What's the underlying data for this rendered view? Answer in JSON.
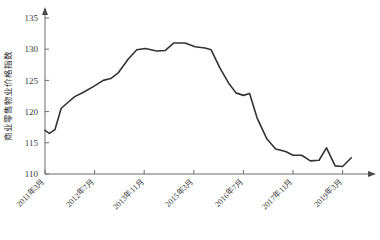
{
  "chart_data": {
    "type": "line",
    "title": "",
    "xlabel": "",
    "ylabel": "商业零售物业价格指数",
    "ylim": [
      110,
      135
    ],
    "yticks": [
      110,
      115,
      120,
      125,
      130,
      135
    ],
    "grid": false,
    "legend": null,
    "axis_arrows": true,
    "line_color": "#333333",
    "xtick_labels": [
      "2011年3月",
      "2012年7月",
      "2013年11月",
      "2015年3月",
      "2016年7月",
      "2017年11月",
      "2019年3月"
    ],
    "xtick_indices": [
      0,
      4,
      8,
      12,
      16,
      20,
      24
    ],
    "x": [
      "2011年3月",
      "2011年7月",
      "2011年11月",
      "2012年3月",
      "2012年7月",
      "2012年11月",
      "2013年3月",
      "2013年7月",
      "2013年11月",
      "2014年3月",
      "2014年7月",
      "2014年11月",
      "2015年3月",
      "2015年7月",
      "2015年11月",
      "2016年3月",
      "2016年7月",
      "2016年11月",
      "2017年3月",
      "2017年7月",
      "2017年11月",
      "2018年3月",
      "2018年7月",
      "2018年11月",
      "2019年3月",
      "2019年7月"
    ],
    "values": [
      117.0,
      116.6,
      117.2,
      120.8,
      122.3,
      123.5,
      124.1,
      125.4,
      126.2,
      126.4,
      128.3,
      130.0,
      130.2,
      129.8,
      131.0,
      130.9,
      130.4,
      130.2,
      127.0,
      125.3,
      125.4,
      122.6,
      122.4,
      116.0,
      114.2,
      114.0
    ],
    "tail_detail": {
      "note": "final segment dips then recovers",
      "points": [
        113.9,
        113.0,
        114.4,
        111.2,
        112.6
      ]
    },
    "series_path": [
      {
        "xi": 0.0,
        "v": 117.0
      },
      {
        "xi": 0.35,
        "v": 116.5
      },
      {
        "xi": 0.8,
        "v": 117.1
      },
      {
        "xi": 1.3,
        "v": 120.5
      },
      {
        "xi": 1.75,
        "v": 121.3
      },
      {
        "xi": 2.4,
        "v": 122.4
      },
      {
        "xi": 3.1,
        "v": 123.1
      },
      {
        "xi": 3.9,
        "v": 124.0
      },
      {
        "xi": 4.7,
        "v": 125.0
      },
      {
        "xi": 5.3,
        "v": 125.3
      },
      {
        "xi": 5.9,
        "v": 126.2
      },
      {
        "xi": 6.7,
        "v": 128.4
      },
      {
        "xi": 7.4,
        "v": 129.9
      },
      {
        "xi": 8.1,
        "v": 130.1
      },
      {
        "xi": 9.0,
        "v": 129.7
      },
      {
        "xi": 9.7,
        "v": 129.8
      },
      {
        "xi": 10.4,
        "v": 131.0
      },
      {
        "xi": 11.3,
        "v": 131.0
      },
      {
        "xi": 12.1,
        "v": 130.4
      },
      {
        "xi": 12.9,
        "v": 130.2
      },
      {
        "xi": 13.4,
        "v": 129.9
      },
      {
        "xi": 14.1,
        "v": 127.0
      },
      {
        "xi": 14.8,
        "v": 124.6
      },
      {
        "xi": 15.4,
        "v": 123.0
      },
      {
        "xi": 16.0,
        "v": 122.6
      },
      {
        "xi": 16.5,
        "v": 122.9
      },
      {
        "xi": 17.1,
        "v": 119.0
      },
      {
        "xi": 17.9,
        "v": 115.6
      },
      {
        "xi": 18.6,
        "v": 114.0
      },
      {
        "xi": 19.4,
        "v": 113.6
      },
      {
        "xi": 20.0,
        "v": 113.0
      },
      {
        "xi": 20.7,
        "v": 113.0
      },
      {
        "xi": 21.4,
        "v": 112.1
      },
      {
        "xi": 22.1,
        "v": 112.2
      },
      {
        "xi": 22.7,
        "v": 114.2
      },
      {
        "xi": 23.4,
        "v": 111.3
      },
      {
        "xi": 24.0,
        "v": 111.2
      },
      {
        "xi": 24.7,
        "v": 112.6
      }
    ]
  }
}
